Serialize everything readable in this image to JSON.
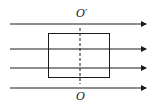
{
  "diagram": {
    "title": "",
    "labels": {
      "top_axis": "O′",
      "bottom_axis": "O"
    },
    "field_lines": [
      {
        "y": 24,
        "x1": 10,
        "x2": 146
      },
      {
        "y": 49,
        "x1": 10,
        "x2": 146
      },
      {
        "y": 68,
        "x1": 10,
        "x2": 146
      },
      {
        "y": 88,
        "x1": 10,
        "x2": 146
      }
    ],
    "loop": {
      "x": 48,
      "y": 33,
      "width": 61,
      "height": 44
    },
    "axis": {
      "x": 80,
      "y1": 28,
      "y2": 84,
      "style": "dashed"
    },
    "colors": {
      "stroke": "#1a1a1a",
      "background": "#ffffff"
    }
  }
}
